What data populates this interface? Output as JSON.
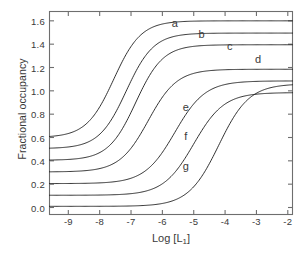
{
  "chart_data": {
    "type": "line",
    "title": "",
    "xlabel": "Log [L1]",
    "xlabel_base": "Log [L",
    "xlabel_sub": "1",
    "xlabel_close": "]",
    "ylabel": "Fractional occupancy",
    "xlim": [
      -9.6,
      -1.85
    ],
    "ylim": [
      -0.06,
      1.68
    ],
    "xticks": [
      -9,
      -8,
      -7,
      -6,
      -5,
      -4,
      -3,
      -2
    ],
    "xticklabels": [
      "-9",
      "-8",
      "-7",
      "-6",
      "-5",
      "-4",
      "-3",
      "-2"
    ],
    "yticks": [
      0.0,
      0.2,
      0.4,
      0.6,
      0.8,
      1.0,
      1.2,
      1.4,
      1.6
    ],
    "yticklabels": [
      "0.0",
      "0.2",
      "0.4",
      "0.6",
      "0.8",
      "1.0",
      "1.2",
      "1.4",
      "1.6"
    ],
    "grid": false,
    "legend": "inline-curve-labels",
    "line_color": "#1a1a1a",
    "frame_color": "#6e6e6e",
    "background": "#ffffff",
    "series": [
      {
        "name": "a",
        "label": "a",
        "bottom": 0.6,
        "top": 1.6,
        "logEC50": -7.55,
        "hill": 1.0,
        "label_x": -5.6,
        "label_y": 1.585
      },
      {
        "name": "b",
        "label": "b",
        "bottom": 0.505,
        "top": 1.495,
        "logEC50": -7.15,
        "hill": 1.0,
        "label_x": -4.75,
        "label_y": 1.485
      },
      {
        "name": "c",
        "label": "c",
        "bottom": 0.405,
        "top": 1.395,
        "logEC50": -6.85,
        "hill": 1.0,
        "label_x": -3.85,
        "label_y": 1.385
      },
      {
        "name": "d",
        "label": "d",
        "bottom": 0.305,
        "top": 1.185,
        "logEC50": -6.45,
        "hill": 0.95,
        "label_x": -2.95,
        "label_y": 1.275
      },
      {
        "name": "e",
        "label": "e",
        "bottom": 0.205,
        "top": 1.085,
        "logEC50": -5.6,
        "hill": 0.9,
        "label_x": -5.25,
        "label_y": 0.865
      },
      {
        "name": "f",
        "label": "f",
        "bottom": 0.105,
        "top": 0.985,
        "logEC50": -5.0,
        "hill": 0.9,
        "label_x": -5.25,
        "label_y": 0.615
      },
      {
        "name": "g",
        "label": "g",
        "bottom": 0.01,
        "top": 1.06,
        "logEC50": -4.2,
        "hill": 0.9,
        "label_x": -5.25,
        "label_y": 0.355
      }
    ]
  }
}
